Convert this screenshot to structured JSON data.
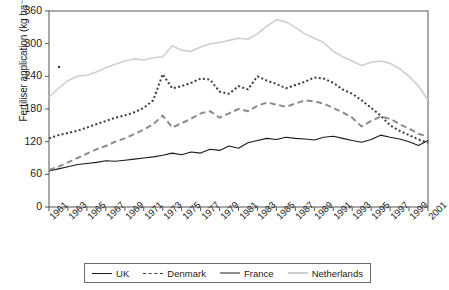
{
  "chart_data": {
    "type": "line",
    "title": "",
    "xlabel": "Year",
    "ylabel": "Fertiliser application (kg ha⁻¹)",
    "xlim": [
      1961,
      2001
    ],
    "ylim": [
      0,
      360
    ],
    "yticks": [
      0,
      60,
      120,
      180,
      240,
      300,
      360
    ],
    "ytick_labels": [
      "0",
      "60",
      "120",
      "180",
      "240",
      "300",
      "360"
    ],
    "xticks": [
      1961,
      1963,
      1965,
      1967,
      1969,
      1971,
      1973,
      1975,
      1977,
      1979,
      1981,
      1983,
      1985,
      1987,
      1989,
      1991,
      1993,
      1995,
      1997,
      1999,
      2001
    ],
    "xtick_labels": [
      "1961",
      "1963",
      "1965",
      "1967",
      "1969",
      "1971",
      "1973",
      "1975",
      "1977",
      "1979",
      "1981",
      "1983",
      "1985",
      "1987",
      "1989",
      "1991",
      "1993",
      "1995",
      "1997",
      "1999",
      "2001"
    ],
    "grid": false,
    "legend_position": "bottom",
    "x": [
      1961,
      1962,
      1963,
      1964,
      1965,
      1966,
      1967,
      1968,
      1969,
      1970,
      1971,
      1972,
      1973,
      1974,
      1975,
      1976,
      1977,
      1978,
      1979,
      1980,
      1981,
      1982,
      1983,
      1984,
      1985,
      1986,
      1987,
      1988,
      1989,
      1990,
      1991,
      1992,
      1993,
      1994,
      1995,
      1996,
      1997,
      1998,
      1999,
      2000,
      2001
    ],
    "series": [
      {
        "name": "UK",
        "color": "#1a1a1a",
        "style": "solid",
        "values": [
          66,
          70,
          74,
          78,
          80,
          82,
          85,
          84,
          86,
          88,
          90,
          92,
          95,
          99,
          96,
          101,
          99,
          106,
          104,
          112,
          108,
          118,
          122,
          126,
          124,
          128,
          126,
          125,
          123,
          128,
          130,
          126,
          122,
          119,
          124,
          132,
          128,
          125,
          120,
          113,
          122
        ]
      },
      {
        "name": "Denmark",
        "color": "#3c3c3c",
        "style": "dotted",
        "values": [
          126,
          132,
          136,
          140,
          146,
          152,
          158,
          164,
          168,
          174,
          182,
          196,
          244,
          218,
          222,
          228,
          236,
          234,
          212,
          208,
          222,
          216,
          240,
          232,
          226,
          218,
          224,
          230,
          238,
          236,
          228,
          216,
          208,
          196,
          182,
          168,
          150,
          140,
          132,
          124,
          118
        ]
      },
      {
        "name": "France",
        "color": "#8c8c8c",
        "style": "dashed",
        "values": [
          68,
          74,
          82,
          90,
          98,
          106,
          112,
          120,
          126,
          134,
          142,
          152,
          168,
          146,
          154,
          162,
          172,
          176,
          164,
          172,
          180,
          176,
          186,
          192,
          188,
          184,
          190,
          196,
          194,
          190,
          182,
          174,
          164,
          148,
          158,
          166,
          162,
          152,
          144,
          134,
          130
        ]
      },
      {
        "name": "Netherlands",
        "color": "#cfcfcf",
        "style": "solid",
        "values": [
          202,
          218,
          232,
          240,
          242,
          248,
          256,
          262,
          268,
          272,
          270,
          274,
          276,
          296,
          288,
          286,
          294,
          300,
          302,
          306,
          310,
          308,
          318,
          332,
          344,
          340,
          330,
          318,
          310,
          302,
          286,
          276,
          268,
          260,
          266,
          268,
          264,
          254,
          240,
          222,
          196
        ]
      }
    ]
  },
  "legend": {
    "items": [
      {
        "label": "UK"
      },
      {
        "label": "Denmark"
      },
      {
        "label": "France"
      },
      {
        "label": "Netherlands"
      }
    ]
  }
}
